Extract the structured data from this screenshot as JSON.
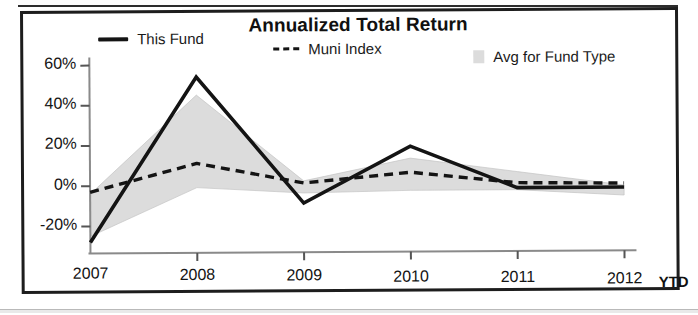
{
  "chart_data": {
    "type": "line",
    "title": "Annualized Total Return",
    "xlabel": "",
    "ylabel": "",
    "categories": [
      "2007",
      "2008",
      "2009",
      "2010",
      "2011",
      "2012"
    ],
    "x_axis_suffix": "YTD",
    "ylim": [
      -30,
      60
    ],
    "ytick_labels": [
      "60%",
      "40%",
      "20%",
      "0%",
      "-20%"
    ],
    "ytick_values": [
      60,
      40,
      20,
      0,
      -20
    ],
    "grid": false,
    "legend_position": "top",
    "series": [
      {
        "name": "This Fund",
        "style": "solid",
        "color": "#141414",
        "values": [
          -28,
          54,
          -9,
          19,
          -2,
          -2
        ]
      },
      {
        "name": "Muni Index",
        "style": "dashed",
        "color": "#141414",
        "values": [
          -3,
          11,
          1,
          6,
          0.5,
          0
        ]
      },
      {
        "name": "Avg for Fund Type",
        "style": "band",
        "color": "#dcdcdc",
        "upper": [
          -4,
          45,
          2,
          13,
          6,
          -1
        ],
        "lower": [
          -25,
          -1,
          -4,
          -3,
          -3,
          -6
        ]
      }
    ]
  },
  "legend": {
    "this_fund": "This Fund",
    "muni_index": "Muni Index",
    "avg_for_fund_type": "Avg for Fund Type",
    "muni_index_prefix": "---"
  },
  "axes": {
    "y_ticks": [
      "60%",
      "40%",
      "20%",
      "0%",
      "-20%"
    ],
    "x_ticks": [
      "2007",
      "2008",
      "2009",
      "2010",
      "2011",
      "2012"
    ],
    "ytd": "YTD"
  }
}
